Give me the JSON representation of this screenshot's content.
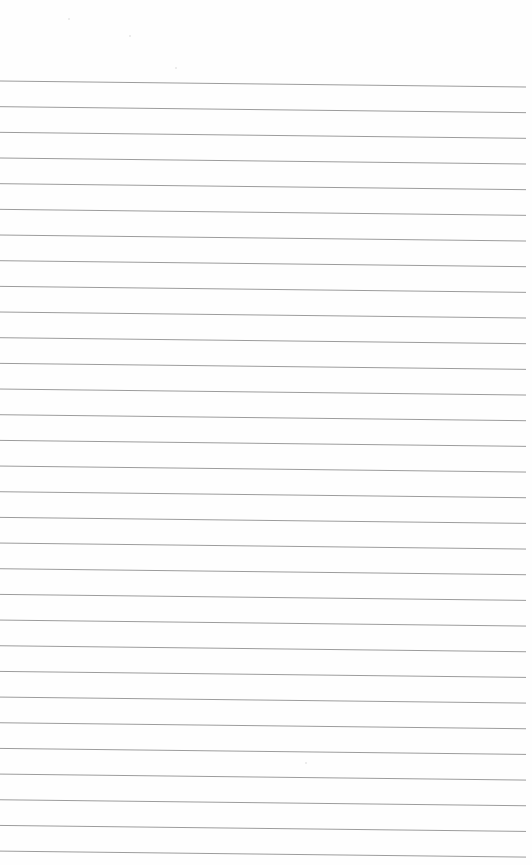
{
  "page": {
    "type": "lined-paper",
    "background": "#fefefe",
    "text": ""
  },
  "rules": {
    "count": 31,
    "color": "#9c9c9c",
    "stroke_width": 1,
    "x_start": 0,
    "x_end": 526,
    "first_y_left": 81,
    "first_y_right": 87,
    "spacing": 25.67
  },
  "specks": [
    {
      "x": 68,
      "y": 18
    },
    {
      "x": 129,
      "y": 35
    },
    {
      "x": 175,
      "y": 67
    },
    {
      "x": 305,
      "y": 762
    }
  ]
}
